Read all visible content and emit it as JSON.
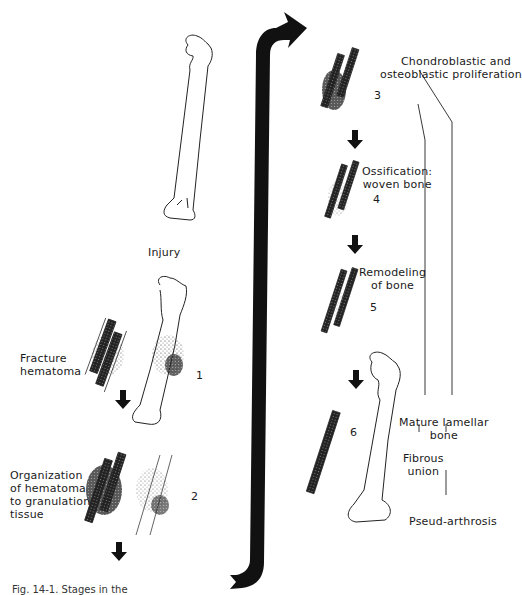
{
  "figure": {
    "caption_fragment": "Fig. 14-1. Stages in the",
    "colors": {
      "ink": "#1a1a1a",
      "paper": "#ffffff"
    }
  },
  "left_column": {
    "injury_label": "Injury",
    "stages": [
      {
        "number": "1",
        "label_lines": [
          "Fracture",
          "hematoma"
        ]
      },
      {
        "number": "2",
        "label_lines": [
          "Organization",
          "of hematoma",
          "to granulation",
          "tissue"
        ]
      }
    ]
  },
  "right_column": {
    "stages": [
      {
        "number": "3",
        "label_lines": [
          "Chondroblastic and",
          "osteoblastic proliferation"
        ]
      },
      {
        "number": "4",
        "label_lines": [
          "Ossification:",
          "woven bone"
        ]
      },
      {
        "number": "5",
        "label_lines": [
          "Remodeling",
          "of bone"
        ]
      },
      {
        "number": "6",
        "label_lines": []
      }
    ],
    "outcomes": [
      {
        "label_lines": [
          "Mature lamellar",
          "bone"
        ]
      },
      {
        "label_lines": [
          "Fibrous",
          "union"
        ]
      },
      {
        "label_lines": [
          "Pseud-arthrosis"
        ]
      }
    ]
  },
  "icons": {
    "flow_arrow": "curved-arrow-icon",
    "step_arrow": "down-arrow-icon"
  }
}
